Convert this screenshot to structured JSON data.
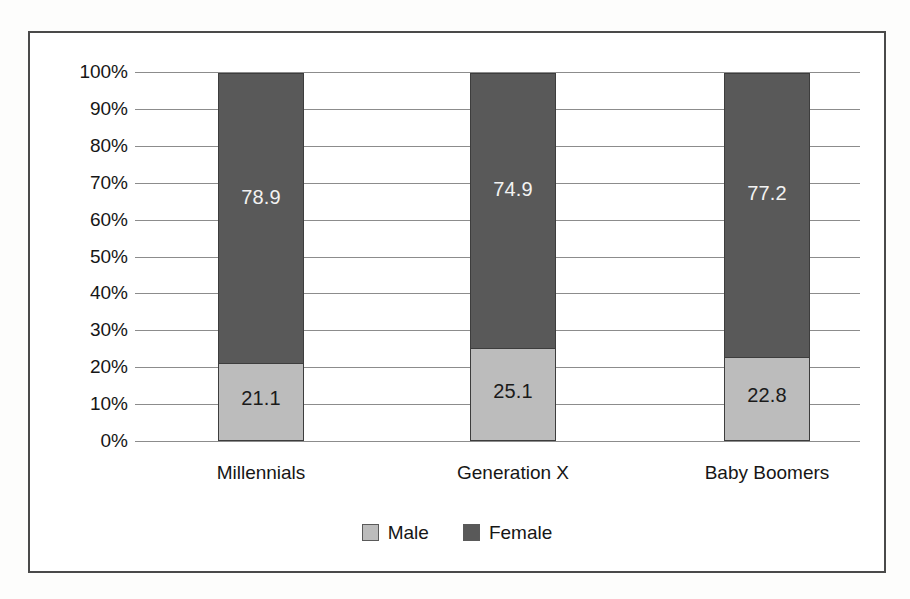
{
  "chart_data": {
    "type": "bar",
    "subtype": "stacked-bar-100-percent",
    "title": "",
    "subtitle": "",
    "xlabel": "",
    "ylabel": "",
    "categories": [
      "Millennials",
      "Generation X",
      "Baby Boomers"
    ],
    "series": [
      {
        "name": "Male",
        "color": "#bcbcbc",
        "label_color": "#1a1a1a",
        "values": [
          21.1,
          25.1,
          22.8
        ],
        "value_labels": [
          "21.1",
          "25.1",
          "22.8"
        ]
      },
      {
        "name": "Female",
        "color": "#595959",
        "label_color": "#f2f2f2",
        "values": [
          78.9,
          74.9,
          77.2
        ],
        "value_labels": [
          "78.9",
          "74.9",
          "77.2"
        ]
      }
    ],
    "stack_order": [
      "Male",
      "Female"
    ],
    "ylim": [
      0,
      100
    ],
    "ytick_values": [
      0,
      10,
      20,
      30,
      40,
      50,
      60,
      70,
      80,
      90,
      100
    ],
    "ytick_labels": [
      "0%",
      "10%",
      "20%",
      "30%",
      "40%",
      "50%",
      "60%",
      "70%",
      "80%",
      "90%",
      "100%"
    ],
    "grid": true,
    "grid_axis": "y",
    "grid_color": "#8c8c8c",
    "legend_position": "bottom",
    "legend_entries": [
      "Male",
      "Female"
    ],
    "frame_border_color": "#4a4a4a",
    "plot_background": "#ffffff",
    "page_background": "#fdfdfc"
  }
}
